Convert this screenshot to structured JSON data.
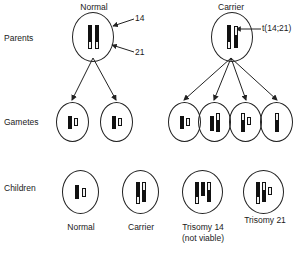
{
  "diagram": {
    "row_labels": {
      "parents": "Parents",
      "gametes": "Gametes",
      "children": "Children"
    },
    "column_headers": {
      "normal_parent": "Normal",
      "carrier_parent": "Carrier"
    },
    "callouts": {
      "chr14": "14",
      "chr21": "21",
      "translocation": "t(14;21)"
    },
    "children_captions": [
      {
        "line1": "Normal",
        "line2": ""
      },
      {
        "line1": "Carrier",
        "line2": ""
      },
      {
        "line1": "Trisomy 14",
        "line2": "(not viable)"
      },
      {
        "line1": "Trisomy 21",
        "line2": ""
      }
    ],
    "colors": {
      "chr14_fill": "#111111",
      "chr21_fill": "#f2f2f2",
      "outline": "#222222",
      "background": "#ffffff",
      "text": "#1a1a1a"
    },
    "legend_meaning": {
      "black_tall_bar": "chromosome 14",
      "white_short_bar": "chromosome 21",
      "two_tone_tall_bar": "translocation chromosome t(14;21)"
    },
    "cells": {
      "parent_normal": {
        "name": "Normal",
        "chromosomes": [
          "14",
          "14",
          "21",
          "21"
        ]
      },
      "parent_carrier": {
        "name": "Carrier",
        "chromosomes": [
          "14",
          "t(14;21)",
          "21"
        ]
      },
      "gametes_normal": [
        {
          "chromosomes": [
            "14",
            "21"
          ]
        },
        {
          "chromosomes": [
            "14",
            "21"
          ]
        }
      ],
      "gametes_carrier": [
        {
          "chromosomes": [
            "14",
            "21"
          ]
        },
        {
          "chromosomes": [
            "14",
            "t(14;21)"
          ]
        },
        {
          "chromosomes": [
            "t(14;21)",
            "21"
          ]
        },
        {
          "chromosomes": [
            "t(14;21)"
          ]
        }
      ],
      "children": [
        {
          "caption": "Normal",
          "chromosomes": [
            "14",
            "21"
          ]
        },
        {
          "caption": "Carrier",
          "chromosomes": [
            "14",
            "t(14;21)",
            "21"
          ]
        },
        {
          "caption": "Trisomy 14",
          "chromosomes": [
            "14",
            "14",
            "t(14;21)",
            "21"
          ]
        },
        {
          "caption": "Trisomy 21",
          "chromosomes": [
            "14",
            "t(14;21)",
            "21",
            "21"
          ]
        }
      ]
    }
  }
}
